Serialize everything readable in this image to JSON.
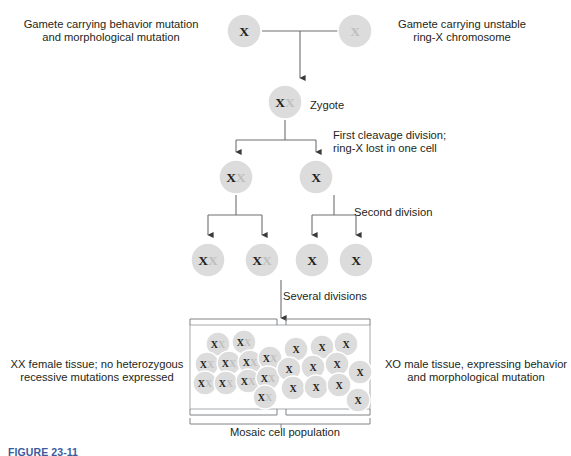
{
  "figure": {
    "caption": "FIGURE 23-11"
  },
  "labels": {
    "gamete_left": "Gamete carrying behavior mutation\nand morphological mutation",
    "gamete_right": "Gamete carrying unstable\nring-X chromosome",
    "zygote": "Zygote",
    "first_cleavage": "First cleavage division;\nring-X lost in one cell",
    "second_division": "Second division",
    "several_divisions": "Several divisions",
    "xx_female_tissue": "XX female tissue; no heterozygous\nrecessive mutations expressed",
    "xo_male_tissue": "XO male tissue, expressing behavior\nand morphological mutation",
    "mosaic_population": "Mosaic cell population"
  },
  "colors": {
    "cell_fill": "#dcdcdc",
    "cell_fill_light": "#e4e4e4",
    "x_dark": "#231f20",
    "x_light": "#bfbfbf",
    "line": "#58595b",
    "box_line": "#a7a9ac",
    "text": "#231f20",
    "caption": "#3b5aa0",
    "background": "#ffffff"
  },
  "chart_data": {
    "type": "diagram",
    "generations": [
      {
        "name": "gametes",
        "y": 31,
        "cells": [
          {
            "id": "gamete-maternal",
            "cx": 244,
            "cy": 31,
            "r": 17,
            "glyphs": [
              {
                "text": "X",
                "tone": "dark"
              }
            ]
          },
          {
            "id": "gamete-ring-x",
            "cx": 355,
            "cy": 31,
            "r": 17,
            "glyphs": [
              {
                "text": "X",
                "tone": "light"
              }
            ]
          }
        ]
      },
      {
        "name": "zygote",
        "y": 102,
        "cells": [
          {
            "id": "zygote",
            "cx": 285,
            "cy": 102,
            "r": 17,
            "glyphs": [
              {
                "text": "X",
                "tone": "dark"
              },
              {
                "text": "X",
                "tone": "light"
              }
            ]
          }
        ]
      },
      {
        "name": "first-cleavage",
        "y": 177,
        "cells": [
          {
            "id": "two-cell-xx",
            "cx": 236,
            "cy": 177,
            "r": 17,
            "glyphs": [
              {
                "text": "X",
                "tone": "dark"
              },
              {
                "text": "X",
                "tone": "light"
              }
            ]
          },
          {
            "id": "two-cell-xo",
            "cx": 316,
            "cy": 177,
            "r": 17,
            "glyphs": [
              {
                "text": "X",
                "tone": "dark"
              }
            ]
          }
        ]
      },
      {
        "name": "second-division",
        "y": 260,
        "cells": [
          {
            "id": "four-cell-xx-1",
            "cx": 208,
            "cy": 260,
            "r": 17,
            "glyphs": [
              {
                "text": "X",
                "tone": "dark"
              },
              {
                "text": "X",
                "tone": "light"
              }
            ]
          },
          {
            "id": "four-cell-xx-2",
            "cx": 262,
            "cy": 260,
            "r": 17,
            "glyphs": [
              {
                "text": "X",
                "tone": "dark"
              },
              {
                "text": "X",
                "tone": "light"
              }
            ]
          },
          {
            "id": "four-cell-xo-1",
            "cx": 312,
            "cy": 260,
            "r": 17,
            "glyphs": [
              {
                "text": "X",
                "tone": "dark"
              }
            ]
          },
          {
            "id": "four-cell-xo-2",
            "cx": 356,
            "cy": 260,
            "r": 17,
            "glyphs": [
              {
                "text": "X",
                "tone": "dark"
              }
            ]
          }
        ]
      }
    ],
    "mosaic_box": {
      "x": 190,
      "y": 325,
      "width": 180,
      "height": 84,
      "split_x": 283
    },
    "mosaic_cells_xx": [
      {
        "cx": 218,
        "cy": 344,
        "r": 12
      },
      {
        "cx": 244,
        "cy": 342,
        "r": 12
      },
      {
        "cx": 207,
        "cy": 364,
        "r": 12
      },
      {
        "cx": 229,
        "cy": 363,
        "r": 12
      },
      {
        "cx": 250,
        "cy": 362,
        "r": 12
      },
      {
        "cx": 270,
        "cy": 358,
        "r": 12
      },
      {
        "cx": 205,
        "cy": 383,
        "r": 12
      },
      {
        "cx": 226,
        "cy": 383,
        "r": 12
      },
      {
        "cx": 248,
        "cy": 381,
        "r": 12
      },
      {
        "cx": 268,
        "cy": 378,
        "r": 12
      },
      {
        "cx": 265,
        "cy": 397,
        "r": 12
      }
    ],
    "mosaic_cells_xo": [
      {
        "cx": 296,
        "cy": 349,
        "r": 12
      },
      {
        "cx": 322,
        "cy": 347,
        "r": 12
      },
      {
        "cx": 346,
        "cy": 344,
        "r": 12
      },
      {
        "cx": 289,
        "cy": 369,
        "r": 12
      },
      {
        "cx": 313,
        "cy": 367,
        "r": 12
      },
      {
        "cx": 337,
        "cy": 364,
        "r": 12
      },
      {
        "cx": 360,
        "cy": 372,
        "r": 12
      },
      {
        "cx": 293,
        "cy": 388,
        "r": 12
      },
      {
        "cx": 316,
        "cy": 387,
        "r": 12
      },
      {
        "cx": 339,
        "cy": 385,
        "r": 12
      },
      {
        "cx": 358,
        "cy": 400,
        "r": 12
      }
    ]
  }
}
